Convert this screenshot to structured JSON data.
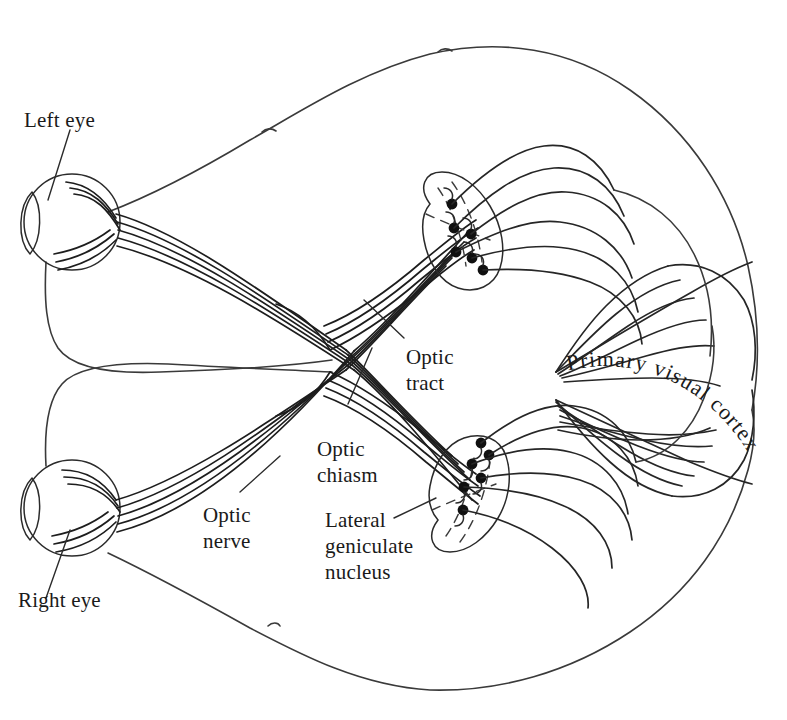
{
  "figure": {
    "kind": "anatomical-diagram",
    "view": "horizontal section of brain viewed from above",
    "background_color": "#ffffff",
    "line_color": "#2b2b2b",
    "dot_color": "#101010"
  },
  "labels": {
    "left_eye": "Left eye",
    "right_eye": "Right eye",
    "optic_nerve_line1": "Optic",
    "optic_nerve_line2": "nerve",
    "optic_chiasm_line1": "Optic",
    "optic_chiasm_line2": "chiasm",
    "optic_tract_line1": "Optic",
    "optic_tract_line2": "tract",
    "lgn_line1": "Lateral",
    "lgn_line2": "geniculate",
    "lgn_line3": "nucleus",
    "primary_visual_cortex": "Primary visual cortex"
  },
  "structures": {
    "eyes": [
      {
        "name": "left-eye",
        "cx": 72,
        "cy": 222,
        "r": 48
      },
      {
        "name": "right-eye",
        "cx": 72,
        "cy": 508,
        "r": 48
      }
    ],
    "optic_chiasm": {
      "cx": 358,
      "cy": 360
    },
    "lateral_geniculate_nuclei": [
      {
        "name": "upper-lgn",
        "cx": 470,
        "cy": 240,
        "cell_count": 6
      },
      {
        "name": "lower-lgn",
        "cx": 478,
        "cy": 490,
        "cell_count": 6
      }
    ],
    "cortex_fold_counts": {
      "upper": 6,
      "lower": 7
    },
    "optic_nerve_fiber_count": 5
  }
}
